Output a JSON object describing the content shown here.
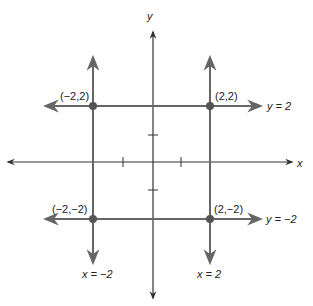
{
  "diagram": {
    "axes": {
      "x_label": "x",
      "y_label": "y"
    },
    "lines": [
      {
        "equation": "y = 2",
        "orientation": "horizontal"
      },
      {
        "equation": "y = −2",
        "orientation": "horizontal"
      },
      {
        "equation": "x = −2",
        "orientation": "vertical"
      },
      {
        "equation": "x = 2",
        "orientation": "vertical"
      }
    ],
    "points": [
      {
        "label": "(−2,2)"
      },
      {
        "label": "(2,2)"
      },
      {
        "label": "(−2,−2)"
      },
      {
        "label": "(2,−2)"
      }
    ],
    "colors": {
      "axis": "#333333",
      "lines": "#666666",
      "points": "#555555"
    }
  }
}
